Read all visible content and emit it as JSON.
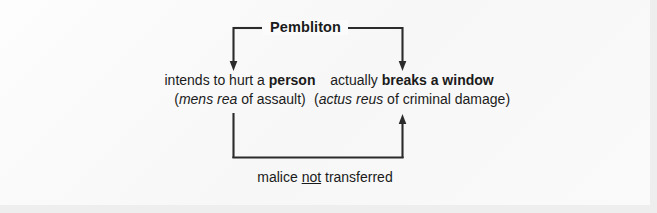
{
  "figure": {
    "background_color": "#fbfbfb",
    "margin_color": "#eeeeee",
    "ink_color": "#2b2b2b"
  },
  "title": {
    "text": "Pembliton"
  },
  "branches": [
    {
      "id": "mens-rea",
      "line1_prefix": "intends to hurt a ",
      "line1_emphasis": "person",
      "line2_open": "(",
      "line2_italic": "mens rea",
      "line2_rest": " of assault)"
    },
    {
      "id": "actus-reus",
      "line1_prefix": "actually ",
      "line1_emphasis": "breaks a window",
      "line2_open": "(",
      "line2_italic": "actus reus",
      "line2_rest": " of criminal damage)"
    }
  ],
  "caption": {
    "prefix": "malice ",
    "underlined": "not",
    "suffix": " transferred"
  },
  "connectors": {
    "top_bracket": "horizontal bar from Pembliton splitting down to both branches",
    "left_arrow": "arrow-down-icon",
    "right_arrow": "arrow-down-icon",
    "return_loop": "rectangle loop from left branch down, across, and up into right branch",
    "return_arrow": "arrow-up-icon"
  }
}
